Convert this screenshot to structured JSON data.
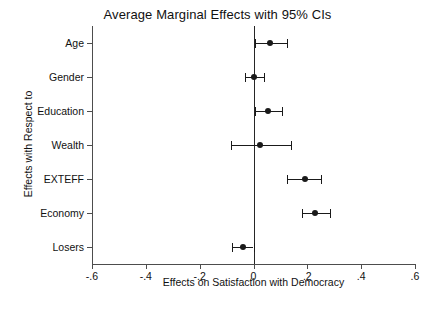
{
  "chart_data": {
    "type": "scatter",
    "title": "Average Marginal Effects with 95% CIs",
    "xlabel": "Effects on Satisfaction with Democracy",
    "ylabel": "Effects with Respect to",
    "xlim": [
      -0.6,
      0.6
    ],
    "xticks": [
      -0.6,
      -0.4,
      -0.2,
      0,
      0.2,
      0.4,
      0.6
    ],
    "xticklabels": [
      "-.6",
      "-.4",
      "-.2",
      "0",
      ".2",
      ".4",
      ".6"
    ],
    "grid": false,
    "legend": null,
    "reference_line_x": 0,
    "categories": [
      "Age",
      "Gender",
      "Education",
      "Wealth",
      "EXTEFF",
      "Economy",
      "Losers"
    ],
    "values": [
      0.06,
      0.0,
      0.055,
      0.025,
      0.19,
      0.23,
      -0.04
    ],
    "ci_low": [
      0.005,
      -0.03,
      0.005,
      -0.085,
      0.125,
      0.18,
      -0.08
    ],
    "ci_high": [
      0.125,
      0.04,
      0.105,
      0.14,
      0.25,
      0.285,
      0.0
    ],
    "points": [
      {
        "label": "Age",
        "estimate": 0.06,
        "ci_low": 0.005,
        "ci_high": 0.125
      },
      {
        "label": "Gender",
        "estimate": 0.0,
        "ci_low": -0.03,
        "ci_high": 0.04
      },
      {
        "label": "Education",
        "estimate": 0.055,
        "ci_low": 0.005,
        "ci_high": 0.105
      },
      {
        "label": "Wealth",
        "estimate": 0.025,
        "ci_low": -0.085,
        "ci_high": 0.14
      },
      {
        "label": "EXTEFF",
        "estimate": 0.19,
        "ci_low": 0.125,
        "ci_high": 0.25
      },
      {
        "label": "Economy",
        "estimate": 0.23,
        "ci_low": 0.18,
        "ci_high": 0.285
      },
      {
        "label": "Losers",
        "estimate": -0.04,
        "ci_low": -0.08,
        "ci_high": 0.0
      }
    ],
    "colors": {
      "marker": "#1a1a1a",
      "ci_line": "#1a1a1a",
      "axis": "#4d4d4d",
      "reference_line": "#262626",
      "background": "#ffffff"
    }
  }
}
